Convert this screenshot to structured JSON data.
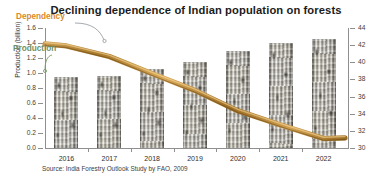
{
  "chart_data": {
    "type": "bar",
    "title": "Declining dependence of Indian population on forests",
    "xlabel": "",
    "ylabel": "Production (billion)",
    "y2label": "Dependency (%)",
    "categories": [
      "2016",
      "2017",
      "2018",
      "2019",
      "2020",
      "2021",
      "2022"
    ],
    "series": [
      {
        "name": "Production",
        "axis": "left",
        "unit": "billion",
        "values": [
          0.95,
          0.96,
          1.05,
          1.15,
          1.3,
          1.4,
          1.45
        ]
      },
      {
        "name": "Dependency",
        "axis": "right",
        "unit": "%",
        "values": [
          42.0,
          40.6,
          38.8,
          36.6,
          34.4,
          32.6,
          31.2
        ]
      }
    ],
    "ylim": [
      0.0,
      1.6
    ],
    "y2lim": [
      30,
      44
    ],
    "yticks": [
      "1.6",
      "1.4",
      "1.2",
      "1.0",
      "0.8",
      "0.6",
      "0.4",
      "0.2",
      "0.0"
    ],
    "y2ticks": [
      "44",
      "42",
      "40",
      "38",
      "36",
      "34",
      "32",
      "30"
    ],
    "grid": false,
    "legend_position": "inline-annotations",
    "annotations": [
      {
        "text": "Dependency",
        "color": "#d98a2b"
      },
      {
        "text": "Production",
        "color": "#6f8f5f"
      }
    ],
    "source": "Source: India Forestry Outlook Study by FAO, 2009"
  },
  "colors": {
    "title": "#1b1b1b",
    "dependency": "#d98a2b",
    "dependency_dark": "#a6701f",
    "production_label": "#6f8f5f",
    "axis": "#8f8f8f",
    "background": "#ffffff"
  }
}
